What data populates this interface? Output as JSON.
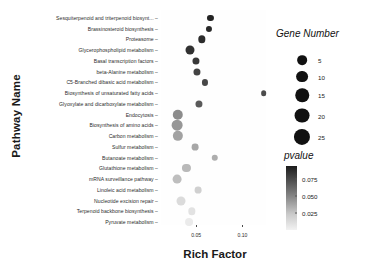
{
  "chart_data": {
    "type": "scatter",
    "title": "",
    "xlabel": "Rich Factor",
    "ylabel": "Pathway Name",
    "xlim": [
      0.012,
      0.132
    ],
    "xticks": [
      0.05,
      0.1
    ],
    "xtick_labels": [
      "0.05",
      "0.10"
    ],
    "grid": false,
    "categories": [
      "Sesquiterpenoid and triterpenoid biosynt...",
      "Brassinosteroid biosynthesis",
      "Proteasome",
      "Glycerophospholipid metabolism",
      "Basal transcription factors",
      "beta-Alanine metabolism",
      "C5-Branched dibasic acid metabolism",
      "Biosynthesis of unsaturated fatty acids",
      "Glyoxylate and dicarboxylate metabolism",
      "Endocytosis",
      "Biosynthesis of amino acids",
      "Carbon metabolism",
      "Sulfur metabolism",
      "Butanoate metabolism",
      "Glutathione metabolism",
      "mRNA surveillance pathway",
      "Linoleic acid metabolism",
      "Nucleotide excision repair",
      "Terpenoid backbone biosynthesis",
      "Pyruvate metabolism"
    ],
    "points": [
      {
        "pathway": "Sesquiterpenoid and triterpenoid biosynt...",
        "rich_factor": 0.0655,
        "gene_number": 4,
        "pvalue": 0.004
      },
      {
        "pathway": "Brassinosteroid biosynthesis",
        "rich_factor": 0.064,
        "gene_number": 4,
        "pvalue": 0.006
      },
      {
        "pathway": "Proteasome",
        "rich_factor": 0.056,
        "gene_number": 8,
        "pvalue": 0.008
      },
      {
        "pathway": "Glycerophospholipid metabolism",
        "rich_factor": 0.043,
        "gene_number": 15,
        "pvalue": 0.01
      },
      {
        "pathway": "Basal transcription factors",
        "rich_factor": 0.05,
        "gene_number": 7,
        "pvalue": 0.013
      },
      {
        "pathway": "beta-Alanine metabolism",
        "rich_factor": 0.0505,
        "gene_number": 7,
        "pvalue": 0.018
      },
      {
        "pathway": "C5-Branched dibasic acid metabolism",
        "rich_factor": 0.0595,
        "gene_number": 4,
        "pvalue": 0.02
      },
      {
        "pathway": "Biosynthesis of unsaturated fatty acids",
        "rich_factor": 0.123,
        "gene_number": 3,
        "pvalue": 0.022
      },
      {
        "pathway": "Glyoxylate and dicarboxylate metabolism",
        "rich_factor": 0.0535,
        "gene_number": 7,
        "pvalue": 0.028
      },
      {
        "pathway": "Endocytosis",
        "rich_factor": 0.03,
        "gene_number": 23,
        "pvalue": 0.05
      },
      {
        "pathway": "Biosynthesis of amino acids",
        "rich_factor": 0.0295,
        "gene_number": 25,
        "pvalue": 0.055
      },
      {
        "pathway": "Carbon metabolism",
        "rich_factor": 0.03,
        "gene_number": 22,
        "pvalue": 0.06
      },
      {
        "pathway": "Sulfur metabolism",
        "rich_factor": 0.049,
        "gene_number": 6,
        "pvalue": 0.062
      },
      {
        "pathway": "Butanoate metabolism",
        "rich_factor": 0.07,
        "gene_number": 5,
        "pvalue": 0.065
      },
      {
        "pathway": "Glutathione metabolism",
        "rich_factor": 0.0395,
        "gene_number": 11,
        "pvalue": 0.07
      },
      {
        "pathway": "mRNA surveillance pathway",
        "rich_factor": 0.029,
        "gene_number": 14,
        "pvalue": 0.072
      },
      {
        "pathway": "Linoleic acid metabolism",
        "rich_factor": 0.052,
        "gene_number": 6,
        "pvalue": 0.08
      },
      {
        "pathway": "Nucleotide excision repair",
        "rich_factor": 0.034,
        "gene_number": 15,
        "pvalue": 0.085
      },
      {
        "pathway": "Terpenoid backbone biosynthesis",
        "rich_factor": 0.045,
        "gene_number": 8,
        "pvalue": 0.088
      },
      {
        "pathway": "Pyruvate metabolism",
        "rich_factor": 0.0425,
        "gene_number": 10,
        "pvalue": 0.092
      }
    ],
    "size_legend": {
      "title": "Gene Number",
      "values": [
        5,
        10,
        15,
        20,
        25
      ],
      "labels": [
        "5",
        "10",
        "15",
        "20",
        "25"
      ]
    },
    "color_legend": {
      "title": "pvalue",
      "ticks": [
        0.075,
        0.05,
        0.025
      ],
      "tick_labels": [
        "0.075",
        "0.050",
        "0.025"
      ],
      "range": [
        0.0,
        0.095
      ],
      "low_color": "#f2f2f2",
      "high_color": "#1c1c1c"
    }
  }
}
